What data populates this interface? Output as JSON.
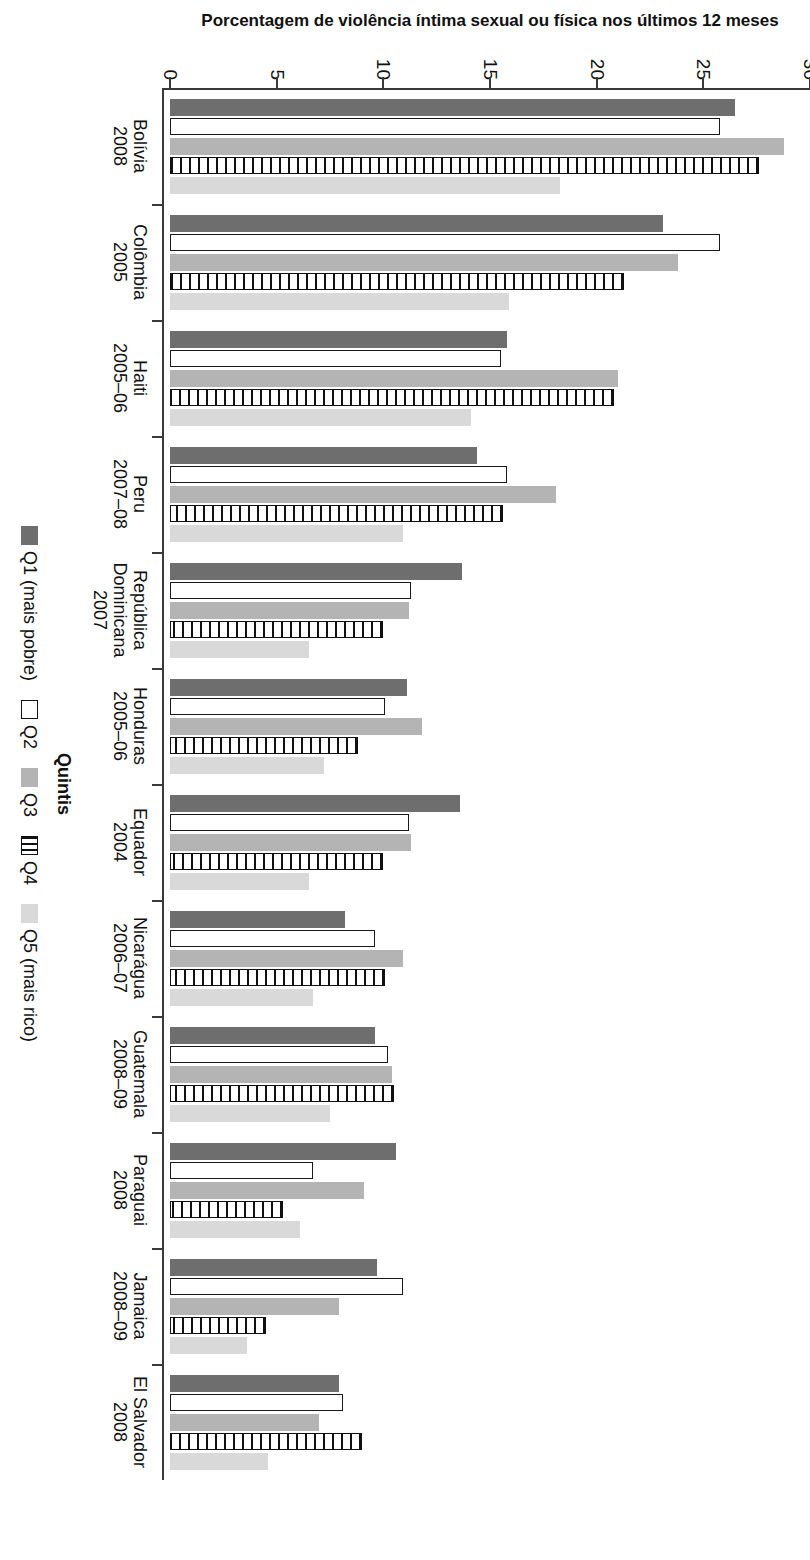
{
  "axis": {
    "y_title": "Porcentagem de violência íntima sexual ou física nos últimos 12 meses",
    "x_title": "Quintis",
    "y_ticks": [
      "0",
      "5",
      "10",
      "15",
      "20",
      "25",
      "30"
    ]
  },
  "legend": {
    "title": "Quintis",
    "items": [
      {
        "key": "q1",
        "label": "Q1 (mais pobre)",
        "color": "#6e6e6e",
        "pattern": "solid-dark"
      },
      {
        "key": "q2",
        "label": "Q2",
        "color": "#ffffff",
        "pattern": "outline"
      },
      {
        "key": "q3",
        "label": "Q3",
        "color": "#b4b4b4",
        "pattern": "solid-mid"
      },
      {
        "key": "q4",
        "label": "Q4",
        "color": "#ffffff",
        "pattern": "hatched"
      },
      {
        "key": "q5",
        "label": "Q5 (mais rico)",
        "color": "#d9d9d9",
        "pattern": "solid-light"
      }
    ]
  },
  "chart_data": {
    "type": "bar",
    "title": "",
    "xlabel": "Quintis",
    "ylabel": "Porcentagem de violência íntima sexual ou física nos últimos 12 meses",
    "ylim": [
      0,
      30
    ],
    "ytick_step": 5,
    "grid": false,
    "legend_position": "bottom",
    "orientation": "vertical-bars-rotated-page",
    "categories": [
      {
        "country": "Bolívia",
        "year": "2008"
      },
      {
        "country": "Colômbia",
        "year": "2005"
      },
      {
        "country": "Haiti",
        "year": "2005–06"
      },
      {
        "country": "Peru",
        "year": "2007–08"
      },
      {
        "country": "República Dominicana",
        "year": "2007"
      },
      {
        "country": "Honduras",
        "year": "2005–06"
      },
      {
        "country": "Equador",
        "year": "2004"
      },
      {
        "country": "Nicarágua",
        "year": "2006–07"
      },
      {
        "country": "Guatemala",
        "year": "2008–09"
      },
      {
        "country": "Paraguai",
        "year": "2008"
      },
      {
        "country": "Jamaica",
        "year": "2008–09"
      },
      {
        "country": "El Salvador",
        "year": "2008"
      }
    ],
    "series": [
      {
        "name": "Q1 (mais pobre)",
        "values": [
          26.5,
          23.1,
          15.8,
          14.4,
          13.7,
          11.1,
          13.6,
          8.2,
          9.6,
          10.6,
          9.7,
          7.9
        ]
      },
      {
        "name": "Q2",
        "values": [
          25.8,
          25.8,
          15.5,
          15.8,
          11.3,
          10.1,
          11.2,
          9.6,
          10.2,
          6.7,
          10.9,
          8.1
        ]
      },
      {
        "name": "Q3",
        "values": [
          28.8,
          23.8,
          21.0,
          18.1,
          11.2,
          11.8,
          11.3,
          10.9,
          10.4,
          9.1,
          7.9,
          7.0
        ]
      },
      {
        "name": "Q4",
        "values": [
          27.6,
          21.3,
          20.8,
          15.6,
          10.0,
          8.8,
          10.0,
          10.1,
          10.5,
          5.3,
          4.5,
          9.0
        ]
      },
      {
        "name": "Q5 (mais rico)",
        "values": [
          18.3,
          15.9,
          14.1,
          10.9,
          6.5,
          7.2,
          6.5,
          6.7,
          7.5,
          6.1,
          3.6,
          4.6
        ]
      }
    ]
  }
}
